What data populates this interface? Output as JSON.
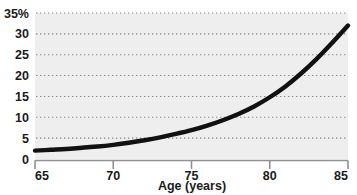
{
  "chart_data": {
    "type": "line",
    "title": "",
    "subtitle": "",
    "xlabel": "Age (years)",
    "ylabel": "",
    "xlim": [
      65,
      85
    ],
    "ylim": [
      0,
      35
    ],
    "grid": true,
    "grid_style": "dotted-horizontal",
    "legend": "none",
    "x_ticks": [
      65,
      70,
      75,
      80,
      85
    ],
    "x_tick_labels": [
      "65",
      "70",
      "75",
      "80",
      "85"
    ],
    "y_ticks": [
      0,
      5,
      10,
      15,
      20,
      25,
      30,
      35
    ],
    "y_tick_labels": [
      "0",
      "5",
      "10",
      "15",
      "20",
      "25",
      "30",
      "35%"
    ],
    "series": [
      {
        "name": "prevalence",
        "x": [
          65,
          66,
          67,
          68,
          69,
          70,
          71,
          72,
          73,
          74,
          75,
          76,
          77,
          78,
          79,
          80,
          81,
          82,
          83,
          84,
          85
        ],
        "values": [
          2.0,
          2.2,
          2.4,
          2.7,
          3.0,
          3.4,
          3.9,
          4.5,
          5.2,
          6.0,
          6.9,
          8.0,
          9.3,
          10.8,
          12.6,
          14.8,
          17.4,
          20.5,
          24.0,
          27.9,
          32.0
        ]
      }
    ],
    "colors": {
      "line": "#111111",
      "plot_background": "#eeeeee",
      "grid": "#8a8a8a",
      "axis": "#808080",
      "text": "#1a1a1a"
    }
  },
  "axes": {
    "x_axis_label": "Age (years)",
    "y_axis_unit": "%"
  }
}
